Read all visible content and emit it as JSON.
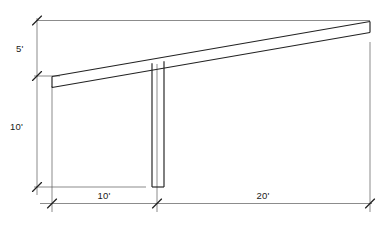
{
  "drawing": {
    "title": "Sloped cantilever beam on single column - elevation",
    "type": "structural-elevation",
    "background_color": "#ffffff",
    "line_color": "#2b2b2b",
    "dimension_line_color": "#555555",
    "width": 388,
    "height": 227
  },
  "dimensions": [
    {
      "id": "vertical-rise",
      "label": "5'",
      "value": 5,
      "unit": "ft",
      "orientation": "vertical",
      "position": "left-upper"
    },
    {
      "id": "column-height",
      "label": "10'",
      "value": 10,
      "unit": "ft",
      "orientation": "vertical",
      "position": "left-lower"
    },
    {
      "id": "left-span",
      "label": "10'",
      "value": 10,
      "unit": "ft",
      "orientation": "horizontal",
      "position": "bottom-left"
    },
    {
      "id": "right-span",
      "label": "20'",
      "value": 20,
      "unit": "ft",
      "orientation": "horizontal",
      "position": "bottom-right"
    }
  ],
  "members": [
    {
      "id": "sloped-beam",
      "name": "sloped-beam",
      "description": "inclined double-line beam rising left to right"
    },
    {
      "id": "column",
      "name": "column",
      "description": "vertical double-line column with closed base"
    }
  ]
}
